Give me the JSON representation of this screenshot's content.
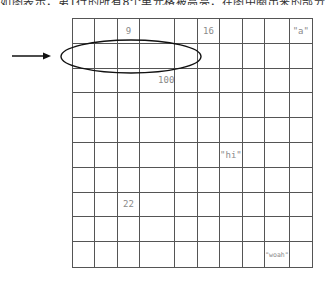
{
  "caption": "如图表示，第1行的所有8个单元格被高亮，在图中圈出来的部分，如下所示。",
  "grid": {
    "rows": 10,
    "cols": 10,
    "cells": [
      {
        "row": 0,
        "col": 2,
        "value": "9"
      },
      {
        "row": 0,
        "col": 5,
        "value": "16"
      },
      {
        "row": 0,
        "col": 9,
        "value": "\"a\""
      },
      {
        "row": 2,
        "col": 3,
        "value": "100",
        "offset": true
      },
      {
        "row": 5,
        "col": 6,
        "value": "\"hi\""
      },
      {
        "row": 7,
        "col": 2,
        "value": "22"
      },
      {
        "row": 9,
        "col": 8,
        "value": "\"woah\"",
        "small": true
      }
    ]
  },
  "annotations": {
    "arrow": {
      "label": "right-arrow",
      "points_to_row": 1
    },
    "ellipse": {
      "label": "highlight-ellipse",
      "row": 1,
      "col_start": 0,
      "col_end": 5
    }
  },
  "colors": {
    "grid_line": "#555555",
    "value_text": "#8a8a8a",
    "annotation": "#111111"
  }
}
